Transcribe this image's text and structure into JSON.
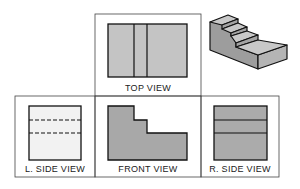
{
  "diagram": {
    "views": {
      "top": {
        "label": "TOP VIEW"
      },
      "left_side": {
        "label": "L. SIDE VIEW"
      },
      "front": {
        "label": "FRONT VIEW"
      },
      "right_side": {
        "label": "R. SIDE VIEW"
      }
    },
    "colors": {
      "frame": "#333333",
      "fill_dark": "#a8a8a8",
      "fill_medium": "#bdbdbd",
      "fill_light": "#f2f2f2",
      "outline": "#111111"
    }
  }
}
